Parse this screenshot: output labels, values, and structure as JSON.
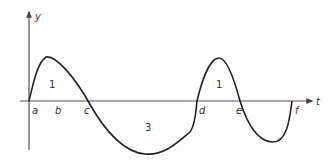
{
  "diagram": {
    "type": "function-graph",
    "axes": {
      "x_label": "t",
      "y_label": "y"
    },
    "points_on_t_axis": [
      "a",
      "b",
      "c",
      "d",
      "e",
      "f"
    ],
    "region_labels": [
      {
        "id": "region-a-c",
        "label": "1"
      },
      {
        "id": "region-c-d",
        "label": "3"
      },
      {
        "id": "region-d-e",
        "label": "1"
      }
    ],
    "ink_color": "#222222",
    "axis_color": "#555555"
  }
}
